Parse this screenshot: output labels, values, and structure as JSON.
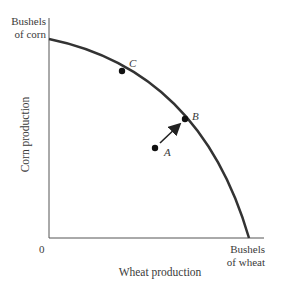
{
  "diagram": {
    "y_axis": {
      "unit_line1": "Bushels",
      "unit_line2": "of corn",
      "label": "Corn production"
    },
    "x_axis": {
      "unit_line1": "Bushels",
      "unit_line2": "of wheat",
      "label": "Wheat production"
    },
    "origin_label": "0",
    "points": [
      {
        "id": "C",
        "label": "C",
        "on_frontier": true
      },
      {
        "id": "B",
        "label": "B",
        "on_frontier": true
      },
      {
        "id": "A",
        "label": "A",
        "on_frontier": false
      }
    ],
    "arrow": {
      "from": "A",
      "to": "B"
    },
    "colors": {
      "curve": "#333333",
      "axes": "#555555",
      "text": "#3a3a3a"
    }
  }
}
